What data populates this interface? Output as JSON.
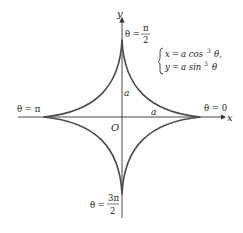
{
  "diagram": {
    "axes": {
      "x_label": "x",
      "y_label": "y",
      "origin_label": "O"
    },
    "equations": {
      "line1": {
        "lhs": "x",
        "rhs_prefix": "a cos",
        "exp": "3",
        "rhs_suffix": "θ,"
      },
      "line2": {
        "lhs": "y",
        "rhs_prefix": "a sin",
        "exp": "3",
        "rhs_suffix": "θ"
      }
    },
    "cusp_labels": {
      "right": "θ = 0",
      "top_theta": "θ =",
      "top_num": "π",
      "top_den": "2",
      "left": "θ = π",
      "bottom_theta": "θ =",
      "bottom_num": "3π",
      "bottom_den": "2"
    },
    "segment_labels": {
      "vertical": "a",
      "horizontal": "a"
    },
    "colors": {
      "curve": "#4a4a4a",
      "axis": "#333333",
      "text": "#222222"
    }
  }
}
